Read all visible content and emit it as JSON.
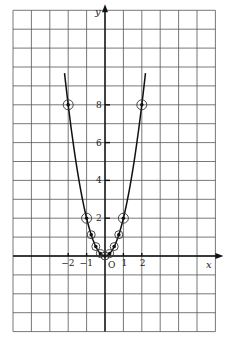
{
  "chart_data": {
    "type": "line",
    "title": "",
    "function": "y = 2x^2",
    "xlabel": "x",
    "ylabel": "y",
    "origin_label": "O",
    "xlim": [
      -5,
      6
    ],
    "ylim": [
      -4,
      13
    ],
    "grid": true,
    "x_ticks": [
      -2,
      -1,
      1,
      2
    ],
    "x_tick_labels": [
      "−2",
      "−1",
      "1",
      "2"
    ],
    "y_ticks": [
      2,
      4,
      6,
      8
    ],
    "y_tick_labels": [
      "2",
      "4",
      "6",
      "8"
    ],
    "series": [
      {
        "name": "y = 2x²",
        "x": [
          -2,
          -1,
          -0.75,
          -0.5,
          -0.25,
          0,
          0.25,
          0.5,
          0.75,
          1,
          2
        ],
        "y": [
          8,
          2,
          1.125,
          0.5,
          0.125,
          0,
          0.125,
          0.5,
          1.125,
          2,
          8
        ]
      }
    ],
    "curve_x_range": [
      -2.2,
      2.2
    ]
  }
}
